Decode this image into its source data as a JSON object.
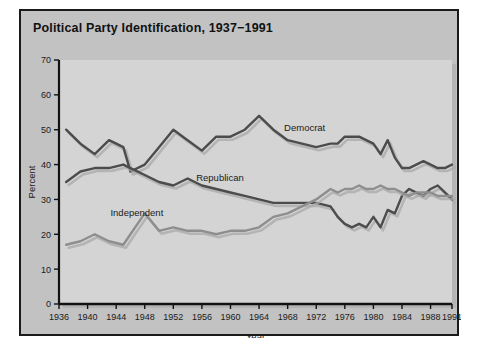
{
  "card": {
    "title": "Political Party Identification, 1937−1991"
  },
  "axes": {
    "ylabel": "Percent",
    "xlabel": "Year",
    "yticks": [
      "0",
      "10",
      "20",
      "30",
      "40",
      "50",
      "60",
      "70"
    ],
    "xticks": [
      "1936",
      "1940",
      "1944",
      "1948",
      "1952",
      "1956",
      "1960",
      "1964",
      "1968",
      "1972",
      "1976",
      "1980",
      "1984",
      "1988",
      "1991"
    ]
  },
  "series_labels": {
    "democrat": "Democrat",
    "republican": "Republican",
    "independent": "Independent"
  },
  "colors": {
    "page_background": "#ffffff",
    "card_background": "#c2c2c2",
    "card_border": "#1a1a1a",
    "plot_background": "#d4d4d4",
    "axis": "#111111",
    "democrat_line": "#4c4c4c",
    "republican_line": "#4c4c4c",
    "independent_line": "#8e8e8e",
    "shadow": "#a9a9a9",
    "title_text": "#111111"
  },
  "chart_data": {
    "type": "line",
    "title": "Political Party Identification, 1937−1991",
    "xlabel": "Year",
    "ylabel": "Percent",
    "xlim": [
      1936,
      1991
    ],
    "ylim": [
      0,
      70
    ],
    "grid": false,
    "legend_position": "inline-annotations",
    "series": [
      {
        "name": "Democrat",
        "color": "#4c4c4c",
        "x": [
          1937,
          1939,
          1941,
          1943,
          1945,
          1946,
          1948,
          1950,
          1952,
          1954,
          1956,
          1958,
          1960,
          1962,
          1964,
          1966,
          1968,
          1970,
          1972,
          1974,
          1975,
          1976,
          1977,
          1978,
          1979,
          1980,
          1981,
          1982,
          1983,
          1984,
          1985,
          1986,
          1987,
          1988,
          1989,
          1990,
          1991
        ],
        "values": [
          50,
          46,
          43,
          47,
          45,
          38,
          40,
          45,
          50,
          47,
          44,
          48,
          48,
          50,
          54,
          50,
          47,
          46,
          45,
          46,
          46,
          48,
          48,
          48,
          47,
          46,
          43,
          47,
          42,
          39,
          39,
          40,
          41,
          40,
          39,
          39,
          40
        ]
      },
      {
        "name": "Republican",
        "color": "#4c4c4c",
        "x": [
          1937,
          1939,
          1941,
          1943,
          1945,
          1946,
          1948,
          1950,
          1952,
          1954,
          1956,
          1958,
          1960,
          1962,
          1964,
          1966,
          1968,
          1970,
          1972,
          1974,
          1975,
          1976,
          1977,
          1978,
          1979,
          1980,
          1981,
          1982,
          1983,
          1984,
          1985,
          1986,
          1987,
          1988,
          1989,
          1990,
          1991
        ],
        "values": [
          35,
          38,
          39,
          39,
          40,
          39,
          37,
          35,
          34,
          36,
          34,
          33,
          32,
          31,
          30,
          29,
          29,
          29,
          29,
          28,
          25,
          23,
          22,
          23,
          22,
          25,
          22,
          27,
          26,
          31,
          33,
          32,
          31,
          33,
          34,
          32,
          30
        ]
      },
      {
        "name": "Independent",
        "color": "#8e8e8e",
        "x": [
          1937,
          1939,
          1941,
          1943,
          1945,
          1946,
          1948,
          1950,
          1952,
          1954,
          1956,
          1958,
          1960,
          1962,
          1964,
          1966,
          1968,
          1970,
          1972,
          1974,
          1975,
          1976,
          1977,
          1978,
          1979,
          1980,
          1981,
          1982,
          1983,
          1984,
          1985,
          1986,
          1987,
          1988,
          1989,
          1990,
          1991
        ],
        "values": [
          17,
          18,
          20,
          18,
          17,
          20,
          26,
          21,
          22,
          21,
          21,
          20,
          21,
          21,
          22,
          25,
          26,
          28,
          30,
          33,
          32,
          33,
          33,
          34,
          33,
          33,
          34,
          33,
          33,
          32,
          31,
          32,
          32,
          32,
          31,
          31,
          31
        ]
      }
    ]
  }
}
